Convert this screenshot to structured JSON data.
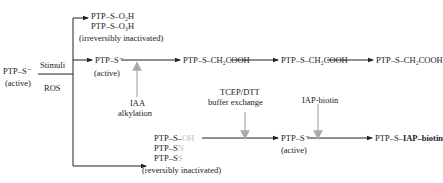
{
  "diagram": {
    "start": {
      "label": "PTP–S⁻",
      "state": "(active)"
    },
    "stimuli_label": "Stimuli",
    "ros_label": "ROS",
    "irreversible": {
      "line1": "PTP–S–O₂H",
      "line2": "PTP–S–O₃H",
      "note": "(irreversibly inactivated)"
    },
    "active_branch": {
      "label": "PTP–S⁻",
      "state": "(active)",
      "reagent1": "IAA",
      "reagent2": "alkylation",
      "product1": "PTP–S–CH₂COOH",
      "product2": "PTP–S–CH₂COOH",
      "product3": "PTP–S–CH₂COOH"
    },
    "reversible": {
      "line1_prefix": "PTP–S–",
      "line1_faded": "OH",
      "line2_prefix": "PTP–S",
      "line2_faded": "N",
      "line3_prefix": "PTP–S",
      "line3_faded": "S",
      "note": "(reversibly inactivated)"
    },
    "tcep": {
      "line1": "TCEP/DTT",
      "line2": "buffer exchange"
    },
    "reactivated": {
      "label": "PTP–S⁻",
      "state": "(active)"
    },
    "iap": {
      "label": "IAP-biotin"
    },
    "final": {
      "prefix": "PTP–S–",
      "bold": "IAP–biotin"
    },
    "colors": {
      "arrow": "#222222",
      "reagent_arrow": "#aaaaaa",
      "faded_text": "#bdbdbd"
    }
  }
}
